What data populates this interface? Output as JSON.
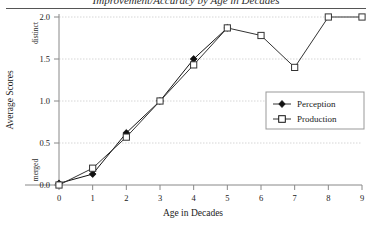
{
  "chart_data": {
    "type": "line",
    "title": "Improvement/Accuracy by Age in Decades",
    "xlabel": "Age in Decades",
    "ylabel": "Average Scores",
    "x": [
      0,
      1,
      2,
      3,
      4,
      5,
      6,
      7,
      8,
      9
    ],
    "xtick_labels": [
      "0",
      "1",
      "2",
      "3",
      "4",
      "5",
      "6",
      "7",
      "8",
      "9"
    ],
    "ytick_labels": [
      "0.0",
      "0.5",
      "1.0",
      "1.5",
      "2.0"
    ],
    "ytick_values": [
      0.0,
      0.5,
      1.0,
      1.5,
      2.0
    ],
    "ylim": [
      0.0,
      2.0
    ],
    "xlim": [
      0,
      9
    ],
    "grid": true,
    "grid_axis": "y",
    "legend_position": "right-middle",
    "y_low_annotation": "merged",
    "y_high_annotation": "distinct",
    "series": [
      {
        "name": "Perception",
        "marker": "filled-diamond",
        "color": "#111111",
        "x": [
          0,
          1,
          2,
          3,
          4,
          5
        ],
        "values": [
          0.02,
          0.13,
          0.62,
          1.0,
          1.5,
          1.87
        ]
      },
      {
        "name": "Production",
        "marker": "open-square",
        "color": "#333333",
        "x": [
          0,
          1,
          2,
          3,
          4,
          5,
          6,
          7,
          8,
          9
        ],
        "values": [
          0.0,
          0.2,
          0.57,
          1.0,
          1.43,
          1.87,
          1.78,
          1.4,
          2.0,
          2.0
        ]
      }
    ]
  },
  "legend": {
    "items": [
      {
        "label": "Perception"
      },
      {
        "label": "Production"
      }
    ]
  }
}
